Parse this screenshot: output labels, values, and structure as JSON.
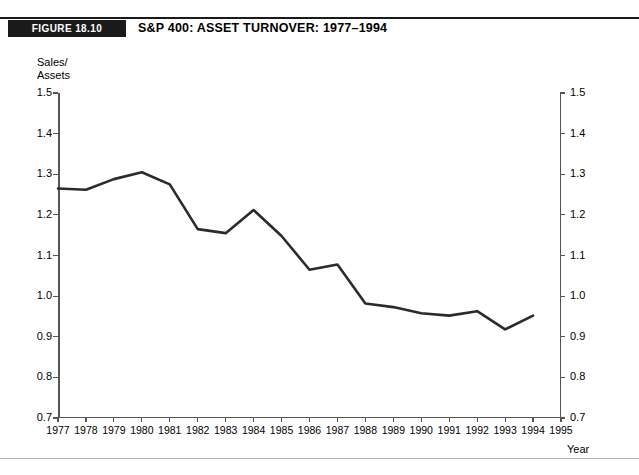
{
  "figure": {
    "tag": "FIGURE 18.10",
    "title": "S&P 400: ASSET TURNOVER: 1977–1994"
  },
  "axes": {
    "y_title": "Sales/\nAssets",
    "x_title": "Year",
    "y_ticks": [
      "0.7",
      "0.8",
      "0.9",
      "1.0",
      "1.1",
      "1.2",
      "1.3",
      "1.4",
      "1.5"
    ],
    "x_ticks": [
      "1977",
      "1978",
      "1979",
      "1980",
      "1981",
      "1982",
      "1983",
      "1984",
      "1985",
      "1986",
      "1987",
      "1988",
      "1989",
      "1990",
      "1991",
      "1992",
      "1993",
      "1994",
      "1995"
    ]
  },
  "colors": {
    "line": "#2b2b2b",
    "axis": "#555555",
    "tag_background": "#1a1a1a",
    "rule": "#1a1a1a",
    "footer_rule": "#b4b4b4",
    "background": "#ffffff"
  },
  "chart_data": {
    "type": "line",
    "title": "S&P 400: ASSET TURNOVER: 1977–1994",
    "xlabel": "Year",
    "ylabel": "Sales/Assets",
    "xlim": [
      1977,
      1995
    ],
    "ylim": [
      0.7,
      1.5
    ],
    "ytick_step": 0.1,
    "grid": false,
    "legend": "none",
    "x": [
      1977,
      1978,
      1979,
      1980,
      1981,
      1982,
      1983,
      1984,
      1985,
      1986,
      1987,
      1988,
      1989,
      1990,
      1991,
      1992,
      1993,
      1994
    ],
    "values": [
      1.265,
      1.262,
      1.288,
      1.305,
      1.275,
      1.165,
      1.155,
      1.212,
      1.148,
      1.065,
      1.078,
      0.982,
      0.973,
      0.958,
      0.952,
      0.963,
      0.918,
      0.952
    ],
    "series": [
      {
        "name": "Sales/Assets",
        "values": [
          1.265,
          1.262,
          1.288,
          1.305,
          1.275,
          1.165,
          1.155,
          1.212,
          1.148,
          1.065,
          1.078,
          0.982,
          0.973,
          0.958,
          0.952,
          0.963,
          0.918,
          0.952
        ]
      }
    ]
  }
}
